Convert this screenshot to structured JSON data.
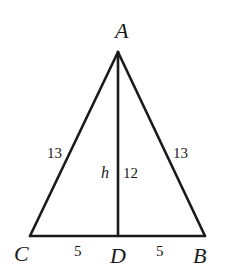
{
  "diagram": {
    "type": "isosceles-triangle-with-altitude",
    "vertices": {
      "A": {
        "label": "A",
        "x": 118,
        "y": 52
      },
      "B": {
        "label": "B",
        "x": 205,
        "y": 236
      },
      "C": {
        "label": "C",
        "x": 30,
        "y": 236
      },
      "D": {
        "label": "D",
        "x": 118,
        "y": 236
      }
    },
    "segments": [
      {
        "from": "A",
        "to": "C",
        "length_label": "13"
      },
      {
        "from": "A",
        "to": "B",
        "length_label": "13"
      },
      {
        "from": "C",
        "to": "D",
        "length_label": "5"
      },
      {
        "from": "D",
        "to": "B",
        "length_label": "5"
      },
      {
        "from": "A",
        "to": "D",
        "length_label": "12",
        "name_label": "h"
      }
    ],
    "labels": {
      "A": "A",
      "B": "B",
      "C": "C",
      "D": "D",
      "AC": "13",
      "AB": "13",
      "CD": "5",
      "DB": "5",
      "AD": "12",
      "altitude": "h"
    },
    "colors": {
      "stroke": "#1a1a1a",
      "background": "#ffffff"
    }
  }
}
